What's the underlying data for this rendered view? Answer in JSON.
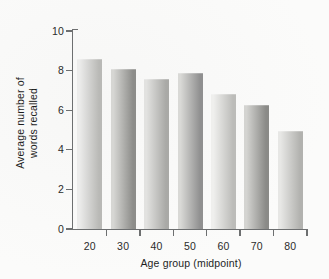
{
  "chart_data": {
    "type": "bar",
    "title": "",
    "subtitle": "",
    "xlabel": "Age group (midpoint)",
    "ylabel": "Average number of words recalled",
    "ylabel_line1": "Average number of",
    "ylabel_line2": "words recalled",
    "categories": [
      "20",
      "30",
      "40",
      "50",
      "60",
      "70",
      "80"
    ],
    "values": [
      8.6,
      8.1,
      7.6,
      7.9,
      6.8,
      6.25,
      4.95
    ],
    "series": [
      {
        "name": "Average number of words recalled",
        "values": [
          8.6,
          8.1,
          7.6,
          7.9,
          6.8,
          6.25,
          4.95
        ]
      }
    ],
    "ylim": [
      0,
      10
    ],
    "y_ticks": [
      "0",
      "2",
      "4",
      "6",
      "8",
      "10"
    ],
    "y_tick_values": [
      0,
      2,
      4,
      6,
      8,
      10
    ],
    "x_ticks": [
      "20",
      "30",
      "40",
      "50",
      "60",
      "70",
      "80"
    ],
    "grid": false,
    "legend": "none",
    "legend_position": "none",
    "bar_style": "vertical gradient-shaded gray columns"
  },
  "colors": {
    "background": "#fbfbfa",
    "axis": "#6d6f70",
    "text": "#1e1e1e",
    "bar_light": "#e6e6e4",
    "bar_mid": "#c9c9c6",
    "bar_dark": "#9c9c99",
    "bar_alt_dark": "#8a8a87"
  }
}
